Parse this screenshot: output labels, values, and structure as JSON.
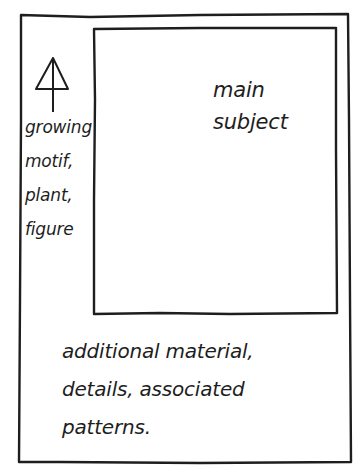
{
  "diagram": {
    "type": "hand-drawn layout sketch",
    "stroke_color": "#1e1e1e",
    "background": "#ffffff",
    "outer_frame": {
      "label": "page"
    },
    "main_panel": {
      "label_lines": [
        "main",
        "subject"
      ]
    },
    "side_strip": {
      "icon": "arrow-up-icon",
      "label_lines": [
        "growing",
        "motif,",
        "plant,",
        "figure"
      ]
    },
    "bottom_area": {
      "label_lines": [
        "additional material,",
        "details, associated",
        "patterns."
      ]
    }
  }
}
